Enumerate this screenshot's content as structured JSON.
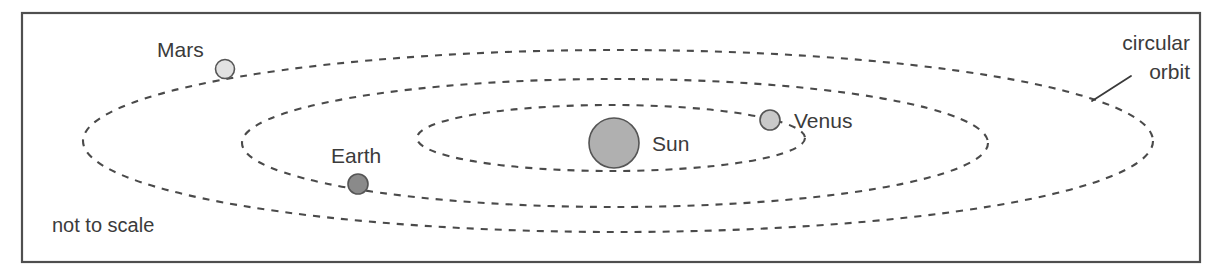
{
  "figure": {
    "caption_note": "not to scale",
    "callout": {
      "line1": "circular",
      "line2": "orbit"
    },
    "frame": {
      "x": 22,
      "y": 13,
      "width": 1178,
      "height": 249,
      "stroke": "#4f4f4f"
    },
    "background": "#ffffff",
    "orbit_stroke": "#4a4a4a"
  },
  "bodies": [
    {
      "id": "sun",
      "label": "Sun",
      "cx": 614,
      "cy": 143,
      "r": 25,
      "fill": "#b0b0b0",
      "label_x": 652,
      "label_y": 151
    },
    {
      "id": "mars",
      "label": "Mars",
      "cx": 225,
      "cy": 69,
      "r": 9.5,
      "fill": "#e2e2e2",
      "label_x": 157,
      "label_y": 57
    },
    {
      "id": "earth",
      "label": "Earth",
      "cx": 358,
      "cy": 184,
      "r": 10,
      "fill": "#8a8a8a",
      "label_x": 331,
      "label_y": 163
    },
    {
      "id": "venus",
      "label": "Venus",
      "cx": 770,
      "cy": 120,
      "r": 10,
      "fill": "#c9c9c9",
      "label_x": 794,
      "label_y": 128
    }
  ],
  "orbits": [
    {
      "id": "venus-orbit",
      "belongs_to": "Venus",
      "cx": 611,
      "cy": 138,
      "rx": 194,
      "ry": 33
    },
    {
      "id": "earth-orbit",
      "belongs_to": "Earth",
      "cx": 615,
      "cy": 143,
      "rx": 373,
      "ry": 64
    },
    {
      "id": "mars-orbit",
      "belongs_to": "Mars",
      "cx": 618,
      "cy": 141,
      "rx": 535,
      "ry": 91
    }
  ],
  "callout_leader": {
    "x1": 1092,
    "y1": 101,
    "x2": 1131,
    "y2": 76
  },
  "note_position": {
    "x": 52,
    "y": 232
  },
  "callout_position": {
    "x": 1190,
    "y": 50,
    "line2_y": 79
  }
}
